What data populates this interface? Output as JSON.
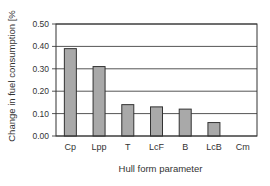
{
  "chart_data": {
    "type": "bar",
    "title": "",
    "xlabel": "Hull form parameter",
    "ylabel": "Change in fuel consumption [%",
    "categories": [
      "Cp",
      "Lpp",
      "T",
      "LcF",
      "B",
      "LcB",
      "Cm"
    ],
    "values": [
      0.39,
      0.31,
      0.14,
      0.13,
      0.12,
      0.06,
      0.0
    ],
    "ylim": [
      0.0,
      0.5
    ],
    "yticks": [
      "0.00",
      "0.10",
      "0.20",
      "0.30",
      "0.40",
      "0.50"
    ],
    "grid": true,
    "legend": null,
    "bar_color": "#a9a9a9",
    "bar_edge_color": "#333333",
    "grid_color": "#555555"
  }
}
